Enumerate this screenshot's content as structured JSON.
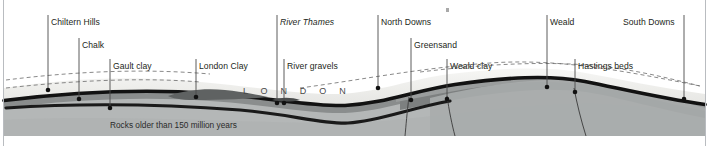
{
  "diagram": {
    "city_label": "L O N D O N",
    "basement_label": "Rocks older than 150 million years",
    "labels": [
      {
        "key": "chiltern_hills",
        "text": "Chiltern Hills",
        "italic": false,
        "x": 51,
        "y": 17,
        "tick_x": 48,
        "tick_y1": 15,
        "tick_y2": 90,
        "dot_x": 48,
        "dot_y": 90
      },
      {
        "key": "chalk",
        "text": "Chalk",
        "italic": false,
        "x": 82,
        "y": 40,
        "tick_x": 79,
        "tick_y1": 38,
        "tick_y2": 99,
        "dot_x": 79,
        "dot_y": 99
      },
      {
        "key": "gault_clay",
        "text": "Gault clay",
        "italic": false,
        "x": 113,
        "y": 61,
        "tick_x": 110,
        "tick_y1": 59,
        "tick_y2": 108,
        "dot_x": 110,
        "dot_y": 108
      },
      {
        "key": "london_clay",
        "text": "London Clay",
        "italic": false,
        "x": 199,
        "y": 61,
        "tick_x": 196,
        "tick_y1": 59,
        "tick_y2": 97,
        "dot_x": 196,
        "dot_y": 97
      },
      {
        "key": "river_thames",
        "text": "River Thames",
        "italic": true,
        "x": 280,
        "y": 17,
        "tick_x": 277,
        "tick_y1": 15,
        "tick_y2": 103,
        "dot_x": 277,
        "dot_y": 103
      },
      {
        "key": "river_gravels",
        "text": "River gravels",
        "italic": false,
        "x": 287,
        "y": 61,
        "tick_x": 284,
        "tick_y1": 59,
        "tick_y2": 103,
        "dot_x": 284,
        "dot_y": 103
      },
      {
        "key": "north_downs",
        "text": "North Downs",
        "italic": false,
        "x": 381,
        "y": 17,
        "tick_x": 378,
        "tick_y1": 15,
        "tick_y2": 88,
        "dot_x": 378,
        "dot_y": 88
      },
      {
        "key": "greensand",
        "text": "Greensand",
        "italic": false,
        "x": 414,
        "y": 40,
        "tick_x": 411,
        "tick_y1": 38,
        "tick_y2": 100,
        "dot_x": 411,
        "dot_y": 100
      },
      {
        "key": "weald_clay",
        "text": "Weald clay",
        "italic": false,
        "x": 450,
        "y": 61,
        "tick_x": 447,
        "tick_y1": 59,
        "tick_y2": 99,
        "dot_x": 447,
        "dot_y": 99
      },
      {
        "key": "weald",
        "text": "Weald",
        "italic": false,
        "x": 550,
        "y": 17,
        "tick_x": 547,
        "tick_y1": 15,
        "tick_y2": 87,
        "dot_x": 547,
        "dot_y": 87
      },
      {
        "key": "hastings_beds",
        "text": "Hastings beds",
        "italic": false,
        "x": 578,
        "y": 61,
        "tick_x": 575,
        "tick_y1": 59,
        "tick_y2": 92,
        "dot_x": 575,
        "dot_y": 92
      },
      {
        "key": "south_downs",
        "text": "South Downs",
        "italic": false,
        "x": 623,
        "y": 17,
        "tick_x": 684,
        "tick_y1": 15,
        "tick_y2": 99,
        "dot_x": 684,
        "dot_y": 99
      }
    ]
  },
  "colors": {
    "chalk": "#ececea",
    "chalk_light": "#f3f3f1",
    "basement": "#b4b7b7",
    "basement_dark": "#a8abab",
    "greensand": "#9a9d9d",
    "weald_clay": "#8a8d8d",
    "hastings": "#7d8080",
    "london_clay": "#6e7171",
    "gravel": "#5c5f5f",
    "dark_band": "#121212",
    "frame": "#b9bcc0",
    "text": "#231f20",
    "dash": "#6b6b6b"
  }
}
